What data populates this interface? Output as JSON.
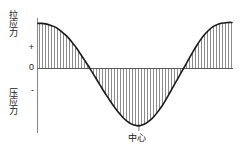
{
  "figure": {
    "title": "",
    "labels": {
      "tensile_stress": "拉应力",
      "compressive_stress": "压应力",
      "center": "中心",
      "tick_plus": "+",
      "tick_zero": "0",
      "tick_minus": "-"
    },
    "colors": {
      "curve": "#1a1a1a",
      "axis": "#7a7a7a",
      "hatch": "#6e6e6e",
      "background": "#ffffff",
      "text": "#1a1a1a"
    }
  },
  "chart_data": {
    "type": "area",
    "title": "",
    "xlabel": "中心",
    "ylabel": "应力",
    "grid": false,
    "legend": null,
    "axis": {
      "y_ticks": [
        "+",
        "0",
        "-"
      ],
      "y_tick_values": [
        1,
        0,
        -1
      ],
      "x_ticks": [
        "中心"
      ],
      "x_tick_values": [
        0.5
      ],
      "xlim": [
        0,
        1
      ],
      "ylim": [
        -1.35,
        1.05
      ],
      "zero_line": 0
    },
    "x": [
      0.0,
      0.02,
      0.04,
      0.06,
      0.08,
      0.1,
      0.12,
      0.14,
      0.16,
      0.18,
      0.2,
      0.22,
      0.24,
      0.26,
      0.28,
      0.3,
      0.32,
      0.34,
      0.36,
      0.38,
      0.4,
      0.42,
      0.44,
      0.46,
      0.48,
      0.5,
      0.52,
      0.54,
      0.56,
      0.58,
      0.6,
      0.62,
      0.64,
      0.66,
      0.68,
      0.7,
      0.72,
      0.74,
      0.76,
      0.78,
      0.8,
      0.82,
      0.84,
      0.86,
      0.88,
      0.9,
      0.92,
      0.94,
      0.96,
      0.98,
      1.0
    ],
    "y": [
      0.92,
      0.92,
      0.91,
      0.89,
      0.86,
      0.82,
      0.76,
      0.69,
      0.61,
      0.51,
      0.41,
      0.29,
      0.17,
      0.05,
      -0.08,
      -0.21,
      -0.34,
      -0.47,
      -0.59,
      -0.71,
      -0.82,
      -0.92,
      -1.01,
      -1.08,
      -1.13,
      -1.16,
      -1.17,
      -1.15,
      -1.11,
      -1.05,
      -0.97,
      -0.87,
      -0.76,
      -0.63,
      -0.49,
      -0.35,
      -0.21,
      -0.07,
      0.07,
      0.21,
      0.35,
      0.48,
      0.6,
      0.7,
      0.78,
      0.85,
      0.89,
      0.92,
      0.93,
      0.94,
      0.94
    ],
    "series": [
      {
        "name": "应力分布",
        "values": [
          0.92,
          0.92,
          0.91,
          0.89,
          0.86,
          0.82,
          0.76,
          0.69,
          0.61,
          0.51,
          0.41,
          0.29,
          0.17,
          0.05,
          -0.08,
          -0.21,
          -0.34,
          -0.47,
          -0.59,
          -0.71,
          -0.82,
          -0.92,
          -1.01,
          -1.08,
          -1.13,
          -1.16,
          -1.17,
          -1.15,
          -1.11,
          -1.05,
          -0.97,
          -0.87,
          -0.76,
          -0.63,
          -0.49,
          -0.35,
          -0.21,
          -0.07,
          0.07,
          0.21,
          0.35,
          0.48,
          0.6,
          0.7,
          0.78,
          0.85,
          0.89,
          0.92,
          0.93,
          0.94,
          0.94
        ]
      }
    ],
    "annotations": [
      {
        "text": "拉应力",
        "position": "top-left-vertical"
      },
      {
        "text": "压应力",
        "position": "bottom-left-vertical"
      },
      {
        "text": "中心",
        "position": "bottom-center"
      }
    ],
    "hatching": {
      "style": "vertical-lines",
      "spacing_px": 3,
      "region": "between curve and zero line"
    }
  }
}
